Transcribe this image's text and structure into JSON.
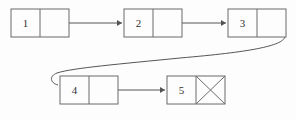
{
  "diagram": {
    "type": "singly-linked-list",
    "title": "",
    "background_color": "#fdfdfd",
    "box_stroke_color": "#6a6a6a",
    "line_color": "#555555",
    "text_color": "#333333",
    "nodes": [
      {
        "id": "node-1",
        "label": "1",
        "x": 11,
        "y": 9,
        "width": 58,
        "height": 28,
        "divider_x": 40,
        "null_pointer": false,
        "row": "top"
      },
      {
        "id": "node-2",
        "label": "2",
        "x": 124,
        "y": 9,
        "width": 58,
        "height": 28,
        "divider_x": 153,
        "null_pointer": false,
        "row": "top"
      },
      {
        "id": "node-3",
        "label": "3",
        "x": 228,
        "y": 9,
        "width": 58,
        "height": 28,
        "divider_x": 257,
        "null_pointer": false,
        "row": "top"
      },
      {
        "id": "node-4",
        "label": "4",
        "x": 60,
        "y": 76,
        "width": 58,
        "height": 28,
        "divider_x": 89,
        "null_pointer": false,
        "row": "bottom"
      },
      {
        "id": "node-5",
        "label": "5",
        "x": 167,
        "y": 76,
        "width": 58,
        "height": 28,
        "divider_x": 196,
        "null_pointer": true,
        "row": "bottom"
      }
    ],
    "links": [
      {
        "id": "link-1-to-2",
        "from": "node-1",
        "to": "node-2",
        "shape": "straight",
        "path": "M 55 23 L 122 23"
      },
      {
        "id": "link-2-to-3",
        "from": "node-2",
        "to": "node-3",
        "shape": "straight",
        "path": "M 168 23 L 226 23"
      },
      {
        "id": "link-3-to-4",
        "from": "node-3",
        "to": "node-4",
        "shape": "curved-wrap",
        "path": "M 271 16 C 281 22, 288 30, 285 37 C 282 46, 250 52, 180 58 C 120 64, 72 68, 57 73 C 49 76, 50 83, 58 85"
      },
      {
        "id": "link-4-to-5",
        "from": "node-4",
        "to": "node-5",
        "shape": "straight",
        "path": "M 104 90 L 165 90"
      }
    ],
    "arrowheads": [
      {
        "id": "arrowhead-into-node-2",
        "target": "node-2",
        "points": "122,23 117,20 117,26"
      },
      {
        "id": "arrowhead-into-node-3",
        "target": "node-3",
        "points": "226,23 221,20 221,26"
      },
      {
        "id": "arrowhead-into-node-4",
        "target": "node-4",
        "points": "68,87 60,83 62,90"
      },
      {
        "id": "arrowhead-into-node-5",
        "target": "node-5",
        "points": "165,90 160,87 160,93"
      }
    ],
    "null_marker": {
      "node": "node-5",
      "symbol": "X",
      "description": "crossed-box null terminator"
    }
  }
}
